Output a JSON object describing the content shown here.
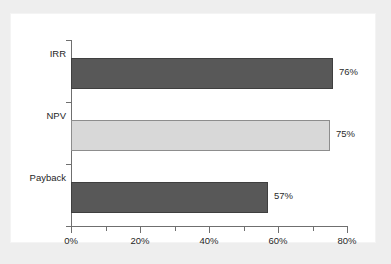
{
  "chart_data": {
    "type": "bar",
    "orientation": "horizontal",
    "title": "",
    "subtitle": "",
    "xlabel": "",
    "ylabel": "",
    "categories": [
      "IRR",
      "NPV",
      "Payback"
    ],
    "values": [
      76,
      75,
      57
    ],
    "value_labels": [
      "76%",
      "75%",
      "57%"
    ],
    "xlim": [
      0,
      80
    ],
    "x_tick_labels": [
      "0%",
      "20%",
      "40%",
      "60%",
      "80%"
    ],
    "x_tick_values": [
      0,
      20,
      40,
      60,
      80
    ],
    "x_minor_tick_values": [
      10,
      30,
      50,
      70
    ],
    "grid": false,
    "legend": "none",
    "series": [
      {
        "name": "Share of respondents",
        "values": [
          76,
          75,
          57
        ]
      }
    ],
    "bar_colors": [
      "#585858",
      "#d8d8d8",
      "#585858"
    ],
    "bar_border_colors": [
      "#3f3f3f",
      "#8d8d8d",
      "#3f3f3f"
    ],
    "axis_color": "#6f6f6f",
    "panel_background": "#ffffff",
    "page_background": "#eeeeee",
    "annotations": []
  }
}
